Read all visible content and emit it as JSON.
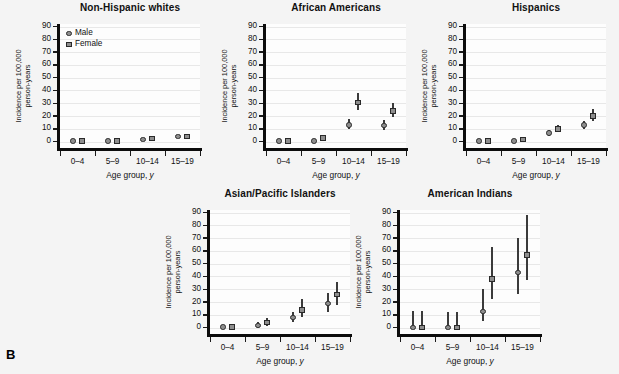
{
  "figure": {
    "panel_letter": "B",
    "background_color": "#f4f4f4",
    "axis_color": "#0c0c0c",
    "marker_fill": "#8e8e8e",
    "marker_edge": "#2a2a2a"
  },
  "legend": {
    "male_label": "Male",
    "female_label": "Female",
    "male_symbol": "circle-marker-icon",
    "female_symbol": "square-marker-icon"
  },
  "axes": {
    "ylabel_line1": "Incidence per 100,000",
    "ylabel_line2": "person-years",
    "xlabel_text": "Age group, ",
    "xlabel_italic": "y",
    "yticks": [
      0,
      10,
      20,
      30,
      40,
      50,
      60,
      70,
      80,
      90
    ],
    "ylim": [
      -5,
      92
    ],
    "categories": [
      "0–4",
      "5–9",
      "10–14",
      "15–19"
    ]
  },
  "chart_data": [
    {
      "type": "scatter",
      "title": "Non-Hispanic whites",
      "xlabel": "Age group, y",
      "ylabel": "Incidence per 100,000 person-years",
      "ylim": [
        -5,
        92
      ],
      "yticks": [
        0,
        10,
        20,
        30,
        40,
        50,
        60,
        70,
        80,
        90
      ],
      "grid": true,
      "legend_position": "top-left",
      "categories": [
        "0–4",
        "5–9",
        "10–14",
        "15–19"
      ],
      "series": [
        {
          "name": "Male",
          "marker": "circle",
          "values": [
            0.3,
            0.4,
            1.8,
            4.0
          ],
          "err_low": [
            0.0,
            0.0,
            1.0,
            2.9
          ],
          "err_high": [
            0.8,
            0.9,
            2.7,
            5.2
          ]
        },
        {
          "name": "Female",
          "marker": "square",
          "values": [
            0.3,
            0.4,
            2.4,
            3.9
          ],
          "err_low": [
            0.0,
            0.0,
            1.5,
            2.8
          ],
          "err_high": [
            0.8,
            0.9,
            3.4,
            5.1
          ]
        }
      ]
    },
    {
      "type": "scatter",
      "title": "African Americans",
      "xlabel": "Age group, y",
      "ylabel": "Incidence per 100,000 person-years",
      "ylim": [
        -5,
        92
      ],
      "yticks": [
        0,
        10,
        20,
        30,
        40,
        50,
        60,
        70,
        80,
        90
      ],
      "grid": true,
      "legend_position": "none",
      "categories": [
        "0–4",
        "5–9",
        "10–14",
        "15–19"
      ],
      "series": [
        {
          "name": "Male",
          "marker": "circle",
          "values": [
            0.4,
            0.6,
            13.0,
            12.5
          ],
          "err_low": [
            0.0,
            0.0,
            9.5,
            9.0
          ],
          "err_high": [
            1.0,
            2.0,
            17.5,
            17.0
          ]
        },
        {
          "name": "Female",
          "marker": "square",
          "values": [
            0.4,
            3.0,
            30.5,
            24.0
          ],
          "err_low": [
            0.0,
            1.2,
            25.0,
            19.5
          ],
          "err_high": [
            1.0,
            5.5,
            38.0,
            30.0
          ]
        }
      ]
    },
    {
      "type": "scatter",
      "title": "Hispanics",
      "xlabel": "Age group, y",
      "ylabel": "Incidence per 100,000 person-years",
      "ylim": [
        -5,
        92
      ],
      "yticks": [
        0,
        10,
        20,
        30,
        40,
        50,
        60,
        70,
        80,
        90
      ],
      "grid": true,
      "legend_position": "none",
      "categories": [
        "0–4",
        "5–9",
        "10–14",
        "15–19"
      ],
      "series": [
        {
          "name": "Male",
          "marker": "circle",
          "values": [
            0.3,
            0.5,
            6.5,
            13.0
          ],
          "err_low": [
            0.0,
            0.0,
            4.5,
            10.0
          ],
          "err_high": [
            0.9,
            1.8,
            9.0,
            16.5
          ]
        },
        {
          "name": "Female",
          "marker": "square",
          "values": [
            0.3,
            1.5,
            10.0,
            20.0
          ],
          "err_low": [
            0.0,
            0.4,
            7.5,
            16.0
          ],
          "err_high": [
            0.9,
            3.0,
            13.0,
            25.5
          ]
        }
      ]
    },
    {
      "type": "scatter",
      "title": "Asian/Pacific Islanders",
      "xlabel": "Age group, y",
      "ylabel": "Incidence per 100,000 person-years",
      "ylim": [
        -5,
        92
      ],
      "yticks": [
        0,
        10,
        20,
        30,
        40,
        50,
        60,
        70,
        80,
        90
      ],
      "grid": true,
      "legend_position": "none",
      "categories": [
        "0–4",
        "5–9",
        "10–14",
        "15–19"
      ],
      "series": [
        {
          "name": "Male",
          "marker": "circle",
          "values": [
            0.4,
            1.5,
            8.0,
            19.0
          ],
          "err_low": [
            0.0,
            0.0,
            4.0,
            12.0
          ],
          "err_high": [
            1.0,
            4.0,
            12.5,
            27.0
          ]
        },
        {
          "name": "Female",
          "marker": "square",
          "values": [
            0.4,
            4.0,
            14.0,
            26.0
          ],
          "err_low": [
            0.0,
            1.0,
            8.0,
            18.0
          ],
          "err_high": [
            1.0,
            7.5,
            22.0,
            36.0
          ]
        }
      ]
    },
    {
      "type": "scatter",
      "title": "American Indians",
      "xlabel": "Age group, y",
      "ylabel": "Incidence per 100,000 person-years",
      "ylim": [
        -5,
        92
      ],
      "yticks": [
        0,
        10,
        20,
        30,
        40,
        50,
        60,
        70,
        80,
        90
      ],
      "grid": true,
      "legend_position": "none",
      "categories": [
        "0–4",
        "5–9",
        "10–14",
        "15–19"
      ],
      "series": [
        {
          "name": "Male",
          "marker": "circle",
          "values": [
            0.0,
            0.0,
            12.5,
            43.0
          ],
          "err_low": [
            0.0,
            0.0,
            5.0,
            26.0
          ],
          "err_high": [
            13.0,
            12.0,
            30.0,
            70.0
          ]
        },
        {
          "name": "Female",
          "marker": "square",
          "values": [
            0.0,
            0.0,
            38.0,
            57.0
          ],
          "err_low": [
            0.0,
            0.0,
            22.0,
            37.0
          ],
          "err_high": [
            13.0,
            12.0,
            63.0,
            88.0
          ]
        }
      ]
    }
  ],
  "panel_geometry": [
    {
      "left": 8,
      "top": 2,
      "plot_left": 52,
      "plot_top": 22,
      "plot_w": 140,
      "plot_h": 124
    },
    {
      "left": 214,
      "top": 2,
      "plot_left": 52,
      "plot_top": 22,
      "plot_w": 140,
      "plot_h": 124
    },
    {
      "left": 414,
      "top": 2,
      "plot_left": 52,
      "plot_top": 22,
      "plot_w": 140,
      "plot_h": 124
    },
    {
      "left": 158,
      "top": 188,
      "plot_left": 52,
      "plot_top": 22,
      "plot_w": 140,
      "plot_h": 124
    },
    {
      "left": 348,
      "top": 188,
      "plot_left": 52,
      "plot_top": 22,
      "plot_w": 140,
      "plot_h": 124
    }
  ]
}
